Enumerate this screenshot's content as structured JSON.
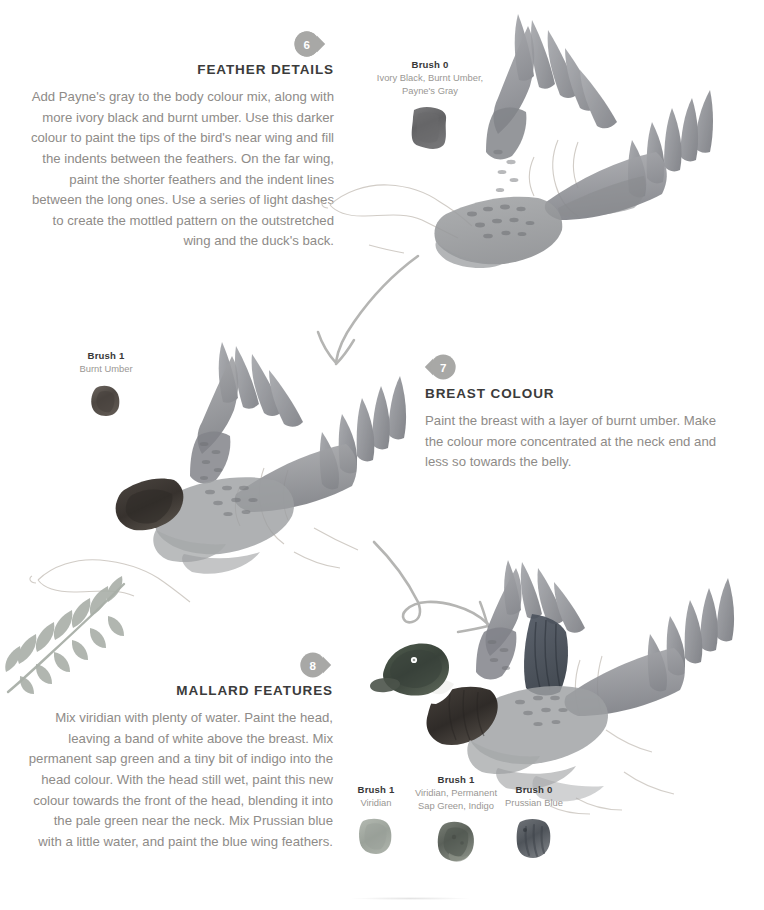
{
  "page": {
    "background": "#ffffff",
    "heading_color": "#3b3b3b",
    "body_color": "#8e8b88",
    "badge_color": "#a8a8a6",
    "accent_sketch": "#b9b9b7"
  },
  "steps": [
    {
      "number": "6",
      "heading": "FEATHER DETAILS",
      "body": "Add Payne's gray to the body colour mix, along with more ivory black and burnt umber. Use this darker colour to paint the tips of the bird's near wing and fill the indents between the feathers. On the far wing, paint the shorter feathers and the indent lines between the long ones. Use a series of light dashes to create the mottled pattern on the outstretched wing and the duck's back.",
      "align": "right"
    },
    {
      "number": "7",
      "heading": "BREAST COLOUR",
      "body": "Paint the breast with a layer of burnt umber. Make the colour more concentrated at the neck end and less so towards the belly.",
      "align": "left"
    },
    {
      "number": "8",
      "heading": "MALLARD FEATURES",
      "body": "Mix viridian with plenty of water. Paint the head, leaving a band of white above the breast. Mix permanent sap green and a tiny bit of indigo into the head colour. With the head still wet, paint this new colour towards the front of the head, blending it into the pale green near the neck. Mix Prussian blue with a little water, and paint the blue wing feathers.",
      "align": "right"
    }
  ],
  "brushes": [
    {
      "id": "brush-top",
      "title": "Brush 0",
      "description": "Ivory Black, Burnt Umber, Payne's Gray",
      "color": "#6d6d6f"
    },
    {
      "id": "brush-left",
      "title": "Brush 1",
      "description": "Burnt Umber",
      "color": "#5d5854"
    },
    {
      "id": "brush-viridian",
      "title": "Brush 1",
      "description": "Viridian",
      "color": "#a3aaa2"
    },
    {
      "id": "brush-sapgreen",
      "title": "Brush 1",
      "description": "Viridian, Permanent Sap Green, Indigo",
      "color": "#6b6f68"
    },
    {
      "id": "brush-prussian",
      "title": "Brush 0",
      "description": "Prussian Blue",
      "color": "#5e6266"
    }
  ],
  "illustrations": [
    {
      "name": "duck-step-6",
      "caption_state": "grayscale wings, uncoloured head"
    },
    {
      "name": "duck-step-7",
      "caption_state": "dark burnt umber breast"
    },
    {
      "name": "duck-step-8",
      "caption_state": "green head, white neck band, blue wing feathers"
    },
    {
      "name": "fern-leaf",
      "caption_state": "decorative sage frond"
    },
    {
      "name": "arrow-6-to-7",
      "caption_state": "curved arrow"
    },
    {
      "name": "arrow-7-to-8",
      "caption_state": "looping curved arrow"
    }
  ]
}
